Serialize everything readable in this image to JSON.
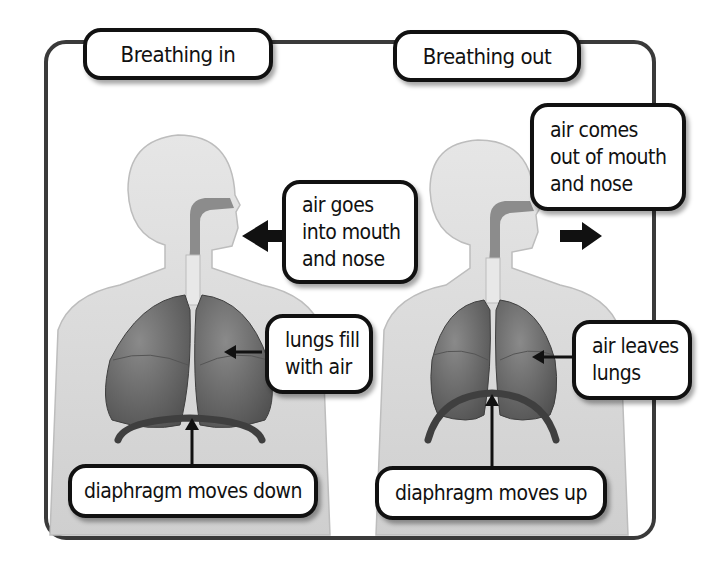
{
  "diagram": {
    "panels": [
      {
        "title": "Breathing in",
        "callouts": {
          "mouth_nose": [
            "air goes",
            "into mouth",
            "and nose"
          ],
          "lungs": [
            "lungs fill",
            "with air"
          ],
          "diaphragm": "diaphragm moves down"
        },
        "airflow_arrow": "arrow-left-into-mouth"
      },
      {
        "title": "Breathing out",
        "callouts": {
          "mouth_nose": [
            "air comes",
            "out of mouth",
            "and nose"
          ],
          "lungs": [
            "air leaves",
            "lungs"
          ],
          "diaphragm": "diaphragm moves up"
        },
        "airflow_arrow": "arrow-right-out-of-mouth"
      }
    ],
    "colors": {
      "frame": "#3a3a3a",
      "body": "#d9d9d9",
      "lungs": "#6e6e6e",
      "diaphragm": "#4a4a4a",
      "label_border": "#111111"
    }
  }
}
